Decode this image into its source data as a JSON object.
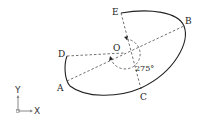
{
  "diagram": {
    "type": "geometric-construction",
    "points": {
      "E": {
        "label": "E",
        "x": 121,
        "y": 13
      },
      "B": {
        "label": "B",
        "x": 184,
        "y": 26
      },
      "O": {
        "label": "O",
        "x": 124,
        "y": 54
      },
      "D": {
        "label": "D",
        "x": 67,
        "y": 56
      },
      "A": {
        "label": "A",
        "x": 67,
        "y": 81
      },
      "C": {
        "label": "C",
        "x": 141,
        "y": 90
      }
    },
    "angle": {
      "label": "275°",
      "value": 275,
      "unit": "degrees"
    },
    "axes": {
      "y_label": "Y",
      "x_label": "X"
    },
    "colors": {
      "stroke": "#222222",
      "dashed": "#333333",
      "background": "#ffffff"
    }
  }
}
